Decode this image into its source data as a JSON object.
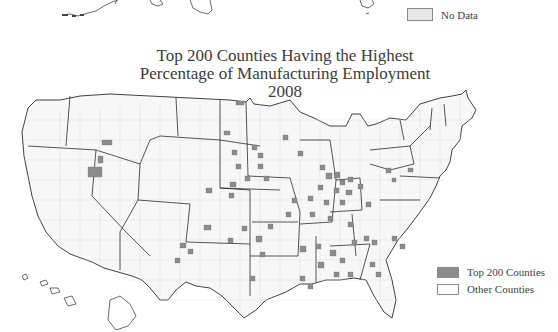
{
  "top_fragment": {
    "legend": {
      "label": "No Data",
      "color": "#e6e6e6"
    }
  },
  "map": {
    "title_lines": [
      "Top 200 Counties Having the Highest",
      "Percentage of Manufacturing Employment",
      "2008"
    ],
    "legend": [
      {
        "label": "Top 200 Counties",
        "color": "#8c8c8c"
      },
      {
        "label": "Other Counties",
        "color": "#ffffff"
      }
    ],
    "colors": {
      "state_border": "#2b2b2b",
      "county_border": "#cfcfcf",
      "highlight": "#8c8c8c",
      "land": "#f7f7f7"
    }
  }
}
